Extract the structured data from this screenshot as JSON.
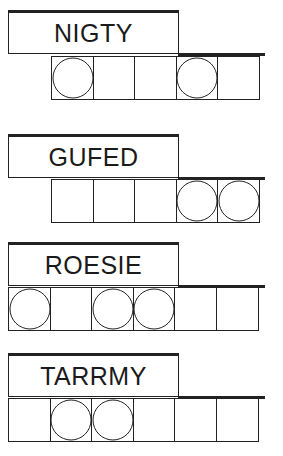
{
  "puzzles": [
    {
      "scrambled": "NIGTY",
      "cells": 5,
      "circled": [
        1,
        4
      ]
    },
    {
      "scrambled": "GUFED",
      "cells": 5,
      "circled": [
        4,
        5
      ]
    },
    {
      "scrambled": "ROESIE",
      "cells": 6,
      "circled": [
        1,
        3,
        4
      ]
    },
    {
      "scrambled": "TARRMY",
      "cells": 6,
      "circled": [
        2,
        3
      ]
    }
  ],
  "colors": {
    "line": "#222222",
    "text": "#1a1a1a",
    "background": "#ffffff"
  }
}
